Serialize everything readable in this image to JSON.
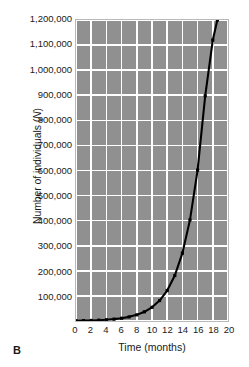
{
  "panel": {
    "label": "B"
  },
  "chart_data": {
    "type": "line",
    "title": "",
    "xlabel": "Time (months)",
    "ylabel": "Number of individuals (N)",
    "ylabel_italic_part": "N",
    "xlim": [
      0,
      20
    ],
    "ylim": [
      0,
      1200000
    ],
    "grid": true,
    "legend_position": "none",
    "x_ticks": [
      0,
      2,
      4,
      6,
      8,
      10,
      12,
      14,
      16,
      18,
      20
    ],
    "x_tick_labels": [
      "0",
      "2",
      "4",
      "6",
      "8",
      "10",
      "12",
      "14",
      "16",
      "18",
      "20"
    ],
    "y_ticks": [
      0,
      100000,
      200000,
      300000,
      400000,
      500000,
      600000,
      700000,
      800000,
      900000,
      1000000,
      1100000,
      1200000
    ],
    "y_tick_labels": [
      "",
      "100,000",
      "200,000",
      "300,000",
      "400,000",
      "500,000",
      "600,000",
      "700,000",
      "800,000",
      "900,000",
      "1,000,000",
      "1,100,000",
      "1,200,000"
    ],
    "series": [
      {
        "name": "Exponential population growth",
        "marker": "square",
        "line_color": "#000000",
        "marker_color": "#000000",
        "x": [
          0,
          1,
          2,
          3,
          4,
          5,
          6,
          7,
          8,
          9,
          10,
          11,
          12,
          13,
          14,
          15,
          16,
          17,
          18,
          18.6
        ],
        "y": [
          1000,
          1500,
          2200,
          3300,
          5000,
          7400,
          11000,
          16500,
          24500,
          36600,
          54600,
          81500,
          121500,
          181300,
          270400,
          403400,
          601800,
          897800,
          1120000,
          1200000
        ]
      }
    ]
  },
  "colors": {
    "plot_background": "#909090",
    "gridline": "#ffffff",
    "curve": "#000000",
    "page_background": "#ffffff",
    "text": "#1a1a1a"
  }
}
